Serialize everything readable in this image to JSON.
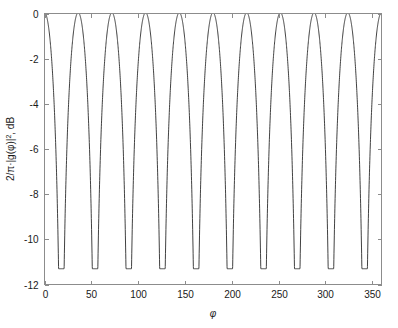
{
  "chart_data": {
    "type": "line",
    "title": "",
    "subtitle": "",
    "xlabel": "φ",
    "ylabel_parts": {
      "prefix": "2/π·|g(φ)|",
      "exponent": "2",
      "suffix": ", dB"
    },
    "ylabel": "2/π·|g(φ)|², dB",
    "xlim": [
      0,
      360
    ],
    "ylim": [
      -12,
      0
    ],
    "xticks": [
      0,
      50,
      100,
      150,
      200,
      250,
      300,
      350
    ],
    "xticklabels": [
      "0",
      "50",
      "100",
      "150",
      "200",
      "250",
      "300",
      "350"
    ],
    "yticks": [
      0,
      -2,
      -4,
      -6,
      -8,
      -10,
      -12
    ],
    "yticklabels": [
      "0",
      "-2",
      "-4",
      "-6",
      "-8",
      "-10",
      "-12"
    ],
    "grid": false,
    "legend": null,
    "legend_position": "none",
    "series": [
      {
        "name": "2/π·|g(φ)|², dB",
        "color": "#2b2b2b",
        "n_cycles": 10,
        "period_deg": 36,
        "peak_value_db": 0,
        "min_value_db": -11.3,
        "peak_positions_deg": [
          0,
          36,
          72,
          108,
          144,
          180,
          216,
          252,
          288,
          324,
          360
        ],
        "min_positions_deg": [
          18,
          54,
          90,
          126,
          162,
          198,
          234,
          270,
          306,
          342
        ],
        "description": "Periodic dB response with ten rounded maxima at 0 dB and ten sharp minima near -11.3 dB over 0 to 360 degrees"
      }
    ]
  },
  "axes": {
    "frame_color": "#8c8c8c",
    "tick_direction": "in",
    "background": "#ffffff"
  }
}
